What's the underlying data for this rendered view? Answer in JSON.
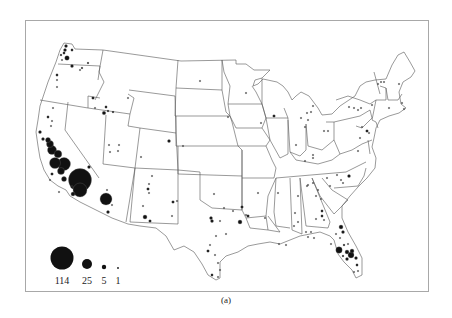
{
  "figure": {
    "caption": "(a)",
    "type": "proportional-symbol-map",
    "region": "Contiguous United States",
    "symbol_color": "#111111",
    "outline_color": "#555555"
  },
  "legend": {
    "items": [
      {
        "value": 114,
        "label": "114",
        "r": 11.5,
        "cx": 62,
        "cy": 258
      },
      {
        "value": 25,
        "label": "25",
        "r": 5,
        "cx": 87,
        "cy": 264
      },
      {
        "value": 5,
        "label": "5",
        "r": 2.2,
        "cx": 104,
        "cy": 267
      },
      {
        "value": 1,
        "label": "1",
        "r": 0.9,
        "cx": 118,
        "cy": 268
      }
    ]
  },
  "symbols": [
    {
      "x": 66,
      "y": 46,
      "r": 1.5
    },
    {
      "x": 65,
      "y": 50,
      "r": 1.5
    },
    {
      "x": 64,
      "y": 53,
      "r": 1.2
    },
    {
      "x": 61,
      "y": 55,
      "r": 1
    },
    {
      "x": 72,
      "y": 50,
      "r": 1.2
    },
    {
      "x": 67,
      "y": 58,
      "r": 2.3
    },
    {
      "x": 72,
      "y": 66,
      "r": 1.5
    },
    {
      "x": 82,
      "y": 68,
      "r": 0.9
    },
    {
      "x": 88,
      "y": 63,
      "r": 0.9
    },
    {
      "x": 80,
      "y": 70,
      "r": 0.8
    },
    {
      "x": 62,
      "y": 60,
      "r": 0.8
    },
    {
      "x": 57,
      "y": 75,
      "r": 1.2
    },
    {
      "x": 57,
      "y": 80,
      "r": 0.8
    },
    {
      "x": 57,
      "y": 87,
      "r": 0.8
    },
    {
      "x": 93,
      "y": 98,
      "r": 1.3
    },
    {
      "x": 106,
      "y": 107,
      "r": 1.2
    },
    {
      "x": 108,
      "y": 111,
      "r": 1
    },
    {
      "x": 104,
      "y": 113,
      "r": 1.8
    },
    {
      "x": 113,
      "y": 112,
      "r": 1
    },
    {
      "x": 128,
      "y": 98,
      "r": 0.8
    },
    {
      "x": 95,
      "y": 108,
      "r": 0.8
    },
    {
      "x": 53,
      "y": 108,
      "r": 0.8
    },
    {
      "x": 48,
      "y": 117,
      "r": 1.2
    },
    {
      "x": 52,
      "y": 121,
      "r": 0.8
    },
    {
      "x": 51,
      "y": 126,
      "r": 0.8
    },
    {
      "x": 40,
      "y": 132,
      "r": 1.5
    },
    {
      "x": 43,
      "y": 139,
      "r": 1.5
    },
    {
      "x": 48,
      "y": 140,
      "r": 2.5
    },
    {
      "x": 50,
      "y": 144,
      "r": 3.5
    },
    {
      "x": 52,
      "y": 150,
      "r": 4.5
    },
    {
      "x": 58,
      "y": 154,
      "r": 3.8
    },
    {
      "x": 55,
      "y": 163,
      "r": 5.5
    },
    {
      "x": 64,
      "y": 164,
      "r": 6.5
    },
    {
      "x": 61,
      "y": 171,
      "r": 3.5
    },
    {
      "x": 64,
      "y": 179,
      "r": 2.5
    },
    {
      "x": 52,
      "y": 174,
      "r": 1.3
    },
    {
      "x": 80,
      "y": 180,
      "r": 11.5
    },
    {
      "x": 80,
      "y": 190,
      "r": 7
    },
    {
      "x": 73,
      "y": 194,
      "r": 2
    },
    {
      "x": 72,
      "y": 187,
      "r": 1.3
    },
    {
      "x": 89,
      "y": 167,
      "r": 1.5
    },
    {
      "x": 50,
      "y": 180,
      "r": 0.8
    },
    {
      "x": 59,
      "y": 192,
      "r": 0.8
    },
    {
      "x": 106,
      "y": 199,
      "r": 6
    },
    {
      "x": 108,
      "y": 212,
      "r": 1.5
    },
    {
      "x": 112,
      "y": 205,
      "r": 0.8
    },
    {
      "x": 107,
      "y": 190,
      "r": 0.8
    },
    {
      "x": 109,
      "y": 145,
      "r": 0.8
    },
    {
      "x": 119,
      "y": 145,
      "r": 0.8
    },
    {
      "x": 110,
      "y": 152,
      "r": 0.8
    },
    {
      "x": 118,
      "y": 151,
      "r": 0.8
    },
    {
      "x": 169,
      "y": 141,
      "r": 1.5
    },
    {
      "x": 183,
      "y": 146,
      "r": 0.8
    },
    {
      "x": 141,
      "y": 157,
      "r": 0.8
    },
    {
      "x": 152,
      "y": 176,
      "r": 0.8
    },
    {
      "x": 149,
      "y": 184,
      "r": 0.8
    },
    {
      "x": 148,
      "y": 189,
      "r": 1.3
    },
    {
      "x": 149,
      "y": 193,
      "r": 0.8
    },
    {
      "x": 173,
      "y": 202,
      "r": 1.3
    },
    {
      "x": 177,
      "y": 201,
      "r": 0.8
    },
    {
      "x": 143,
      "y": 206,
      "r": 0.8
    },
    {
      "x": 145,
      "y": 217,
      "r": 2
    },
    {
      "x": 150,
      "y": 221,
      "r": 1.3
    },
    {
      "x": 172,
      "y": 216,
      "r": 0.8
    },
    {
      "x": 200,
      "y": 81,
      "r": 0.8
    },
    {
      "x": 228,
      "y": 117,
      "r": 0.8
    },
    {
      "x": 246,
      "y": 93,
      "r": 0.8
    },
    {
      "x": 214,
      "y": 194,
      "r": 0.8
    },
    {
      "x": 212,
      "y": 221,
      "r": 1.5
    },
    {
      "x": 211,
      "y": 218,
      "r": 1.5
    },
    {
      "x": 220,
      "y": 221,
      "r": 0.8
    },
    {
      "x": 224,
      "y": 208,
      "r": 0.8
    },
    {
      "x": 233,
      "y": 211,
      "r": 0.8
    },
    {
      "x": 242,
      "y": 207,
      "r": 1.3
    },
    {
      "x": 240,
      "y": 222,
      "r": 2
    },
    {
      "x": 226,
      "y": 234,
      "r": 0.8
    },
    {
      "x": 216,
      "y": 236,
      "r": 0.8
    },
    {
      "x": 208,
      "y": 251,
      "r": 1.3
    },
    {
      "x": 210,
      "y": 245,
      "r": 0.8
    },
    {
      "x": 215,
      "y": 255,
      "r": 0.8
    },
    {
      "x": 218,
      "y": 263,
      "r": 0.8
    },
    {
      "x": 212,
      "y": 275,
      "r": 1.2
    },
    {
      "x": 218,
      "y": 277,
      "r": 0.8
    },
    {
      "x": 220,
      "y": 270,
      "r": 0.8
    },
    {
      "x": 248,
      "y": 216,
      "r": 1.3
    },
    {
      "x": 258,
      "y": 193,
      "r": 0.8
    },
    {
      "x": 246,
      "y": 215,
      "r": 0.8
    },
    {
      "x": 265,
      "y": 218,
      "r": 0.8
    },
    {
      "x": 274,
      "y": 116,
      "r": 1.3
    },
    {
      "x": 261,
      "y": 123,
      "r": 0.8
    },
    {
      "x": 278,
      "y": 193,
      "r": 0.8
    },
    {
      "x": 301,
      "y": 118,
      "r": 0.8
    },
    {
      "x": 307,
      "y": 113,
      "r": 0.8
    },
    {
      "x": 311,
      "y": 112,
      "r": 0.8
    },
    {
      "x": 308,
      "y": 120,
      "r": 0.8
    },
    {
      "x": 313,
      "y": 106,
      "r": 0.8
    },
    {
      "x": 305,
      "y": 127,
      "r": 0.8
    },
    {
      "x": 296,
      "y": 145,
      "r": 0.8
    },
    {
      "x": 324,
      "y": 131,
      "r": 0.8
    },
    {
      "x": 328,
      "y": 131,
      "r": 0.8
    },
    {
      "x": 305,
      "y": 161,
      "r": 0.8
    },
    {
      "x": 313,
      "y": 158,
      "r": 0.8
    },
    {
      "x": 313,
      "y": 155,
      "r": 0.8
    },
    {
      "x": 349,
      "y": 107,
      "r": 0.8
    },
    {
      "x": 354,
      "y": 108,
      "r": 0.8
    },
    {
      "x": 358,
      "y": 110,
      "r": 0.8
    },
    {
      "x": 361,
      "y": 108,
      "r": 0.8
    },
    {
      "x": 372,
      "y": 105,
      "r": 0.8
    },
    {
      "x": 378,
      "y": 84,
      "r": 0.8
    },
    {
      "x": 381,
      "y": 82,
      "r": 0.8
    },
    {
      "x": 384,
      "y": 82,
      "r": 0.8
    },
    {
      "x": 399,
      "y": 84,
      "r": 0.8
    },
    {
      "x": 389,
      "y": 108,
      "r": 0.8
    },
    {
      "x": 402,
      "y": 103,
      "r": 0.8
    },
    {
      "x": 404,
      "y": 109,
      "r": 0.8
    },
    {
      "x": 362,
      "y": 127,
      "r": 0.8
    },
    {
      "x": 367,
      "y": 131,
      "r": 1.3
    },
    {
      "x": 369,
      "y": 133,
      "r": 0.8
    },
    {
      "x": 360,
      "y": 138,
      "r": 0.8
    },
    {
      "x": 358,
      "y": 151,
      "r": 0.8
    },
    {
      "x": 327,
      "y": 178,
      "r": 0.8
    },
    {
      "x": 337,
      "y": 175,
      "r": 0.8
    },
    {
      "x": 341,
      "y": 180,
      "r": 0.8
    },
    {
      "x": 349,
      "y": 176,
      "r": 1.5
    },
    {
      "x": 343,
      "y": 183,
      "r": 0.8
    },
    {
      "x": 313,
      "y": 183,
      "r": 0.8
    },
    {
      "x": 318,
      "y": 190,
      "r": 0.8
    },
    {
      "x": 307,
      "y": 186,
      "r": 0.8
    },
    {
      "x": 330,
      "y": 186,
      "r": 0.8
    },
    {
      "x": 295,
      "y": 213,
      "r": 0.8
    },
    {
      "x": 298,
      "y": 222,
      "r": 0.8
    },
    {
      "x": 294,
      "y": 226,
      "r": 0.8
    },
    {
      "x": 298,
      "y": 196,
      "r": 0.8
    },
    {
      "x": 308,
      "y": 185,
      "r": 0.8
    },
    {
      "x": 316,
      "y": 196,
      "r": 0.8
    },
    {
      "x": 321,
      "y": 199,
      "r": 0.8
    },
    {
      "x": 322,
      "y": 211,
      "r": 1.2
    },
    {
      "x": 322,
      "y": 216,
      "r": 1.2
    },
    {
      "x": 324,
      "y": 220,
      "r": 0.8
    },
    {
      "x": 316,
      "y": 219,
      "r": 0.8
    },
    {
      "x": 311,
      "y": 232,
      "r": 0.8
    },
    {
      "x": 279,
      "y": 244,
      "r": 0.8
    },
    {
      "x": 286,
      "y": 245,
      "r": 0.8
    },
    {
      "x": 341,
      "y": 227,
      "r": 2
    },
    {
      "x": 343,
      "y": 232,
      "r": 1.5
    },
    {
      "x": 336,
      "y": 234,
      "r": 0.8
    },
    {
      "x": 340,
      "y": 238,
      "r": 0.8
    },
    {
      "x": 344,
      "y": 245,
      "r": 1
    },
    {
      "x": 348,
      "y": 244,
      "r": 0.8
    },
    {
      "x": 339,
      "y": 250,
      "r": 3.2
    },
    {
      "x": 347,
      "y": 252,
      "r": 2
    },
    {
      "x": 352,
      "y": 251,
      "r": 2
    },
    {
      "x": 351,
      "y": 255,
      "r": 3
    },
    {
      "x": 356,
      "y": 258,
      "r": 1.5
    },
    {
      "x": 347,
      "y": 259,
      "r": 1.5
    },
    {
      "x": 343,
      "y": 256,
      "r": 1
    },
    {
      "x": 357,
      "y": 265,
      "r": 1.2
    },
    {
      "x": 358,
      "y": 271,
      "r": 0.8
    },
    {
      "x": 354,
      "y": 272,
      "r": 0.8
    },
    {
      "x": 331,
      "y": 244,
      "r": 0.8
    },
    {
      "x": 314,
      "y": 238,
      "r": 0.8
    },
    {
      "x": 308,
      "y": 237,
      "r": 0.8
    },
    {
      "x": 306,
      "y": 232,
      "r": 0.8
    }
  ]
}
